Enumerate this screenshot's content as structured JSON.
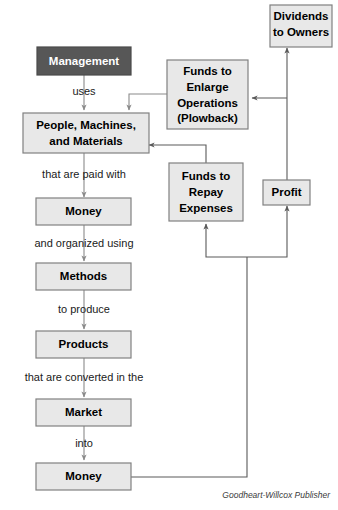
{
  "diagram": {
    "credit": "Goodheart-Willcox Publisher",
    "colors": {
      "box_fill": "#e8e8e8",
      "box_stroke": "#808080",
      "highlight_fill": "#575757",
      "highlight_text": "#ffffff",
      "connector": "#8a8a8a",
      "background": "#ffffff"
    },
    "nodes": [
      {
        "id": "management",
        "label": "Management",
        "style": "dark"
      },
      {
        "id": "people",
        "label": "People, Machines,\nand Materials",
        "style": "light"
      },
      {
        "id": "money1",
        "label": "Money",
        "style": "light"
      },
      {
        "id": "methods",
        "label": "Methods",
        "style": "light"
      },
      {
        "id": "products",
        "label": "Products",
        "style": "light"
      },
      {
        "id": "market",
        "label": "Market",
        "style": "light"
      },
      {
        "id": "money2",
        "label": "Money",
        "style": "light"
      },
      {
        "id": "plowback",
        "label": "Funds to\nEnlarge\nOperations\n(Plowback)",
        "style": "light"
      },
      {
        "id": "repay",
        "label": "Funds to\nRepay\nExpenses",
        "style": "light"
      },
      {
        "id": "profit",
        "label": "Profit",
        "style": "light"
      },
      {
        "id": "dividends",
        "label": "Dividends\nto Owners",
        "style": "light"
      }
    ],
    "node_labels": {
      "management": "Management",
      "people_line1": "People, Machines,",
      "people_line2": "and Materials",
      "money1": "Money",
      "methods": "Methods",
      "products": "Products",
      "market": "Market",
      "money2": "Money",
      "plowback_line1": "Funds to",
      "plowback_line2": "Enlarge",
      "plowback_line3": "Operations",
      "plowback_line4": "(Plowback)",
      "repay_line1": "Funds to",
      "repay_line2": "Repay",
      "repay_line3": "Expenses",
      "profit": "Profit",
      "dividends_line1": "Dividends",
      "dividends_line2": "to Owners"
    },
    "edge_labels": {
      "uses": "uses",
      "paid_with": "that are paid with",
      "organized_using": "and organized using",
      "to_produce": "to produce",
      "converted": "that are converted in the",
      "into": "into"
    },
    "flow_sequence": [
      "Management uses People, Machines, and Materials",
      "People, Machines, and Materials that are paid with Money",
      "Money and organized using Methods",
      "Methods to produce Products",
      "Products that are converted in the Market",
      "Market into Money",
      "Money feeds Funds to Repay Expenses and Profit",
      "Profit feeds Dividends to Owners and Funds to Enlarge Operations (Plowback)",
      "Funds to Enlarge Operations (Plowback) returns to People, Machines, and Materials",
      "Funds to Repay Expenses returns to People, Machines, and Materials"
    ]
  }
}
